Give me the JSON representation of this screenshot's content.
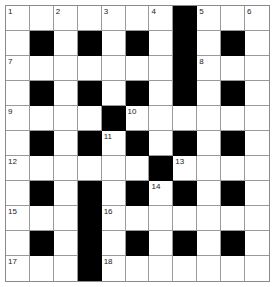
{
  "puzzle": {
    "rows": 11,
    "cols": 11,
    "colors": {
      "black": "#000000",
      "white": "#ffffff",
      "line": "#9a9a9a"
    },
    "layout": [
      "0000000#000",
      "0#0#0#0#0#0",
      "0000000#000",
      "0#0#0#0#0#0",
      "0000#000000",
      "0#0#0#0#0#0",
      "000000#0000",
      "0#0#0#0#0#0",
      "000#0000000",
      "0#0#0#0#0#0",
      "000#0000000"
    ],
    "numbers": [
      {
        "r": 0,
        "c": 0,
        "n": "1"
      },
      {
        "r": 0,
        "c": 2,
        "n": "2"
      },
      {
        "r": 0,
        "c": 4,
        "n": "3"
      },
      {
        "r": 0,
        "c": 6,
        "n": "4"
      },
      {
        "r": 0,
        "c": 8,
        "n": "5"
      },
      {
        "r": 0,
        "c": 10,
        "n": "6"
      },
      {
        "r": 2,
        "c": 0,
        "n": "7"
      },
      {
        "r": 2,
        "c": 8,
        "n": "8"
      },
      {
        "r": 4,
        "c": 0,
        "n": "9"
      },
      {
        "r": 4,
        "c": 5,
        "n": "10"
      },
      {
        "r": 5,
        "c": 4,
        "n": "11"
      },
      {
        "r": 6,
        "c": 0,
        "n": "12"
      },
      {
        "r": 6,
        "c": 7,
        "n": "13"
      },
      {
        "r": 7,
        "c": 6,
        "n": "14"
      },
      {
        "r": 8,
        "c": 0,
        "n": "15"
      },
      {
        "r": 8,
        "c": 4,
        "n": "16"
      },
      {
        "r": 10,
        "c": 0,
        "n": "17"
      },
      {
        "r": 10,
        "c": 4,
        "n": "18"
      }
    ]
  }
}
